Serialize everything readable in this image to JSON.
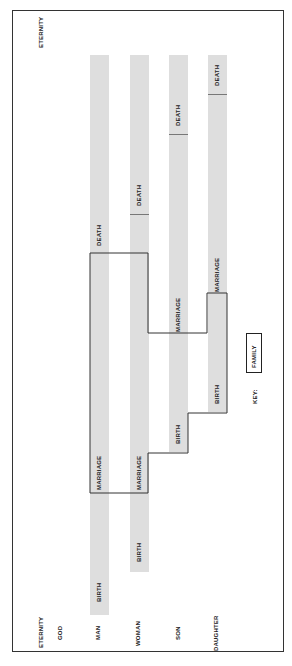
{
  "diagram": {
    "row_labels": {
      "eternity_top": "ETERNITY",
      "eternity_bottom": "ETERNITY",
      "god": "GOD",
      "man": "MAN",
      "woman": "WOMAN",
      "son": "SON",
      "daughter": "DAUGHTER"
    },
    "lifelines": [
      {
        "name": "MAN",
        "birth": "BIRTH",
        "marriage": "MARRIAGE",
        "death": "DEATH"
      },
      {
        "name": "WOMAN",
        "birth": "BIRTH",
        "marriage": "MARRIAGE",
        "death": "DEATH"
      },
      {
        "name": "SON",
        "birth": "BIRTH",
        "marriage": "MARRIAGE",
        "death": "DEATH"
      },
      {
        "name": "DAUGHTER",
        "birth": "BIRTH",
        "marriage": "MARRIAGE",
        "death": "DEATH"
      }
    ],
    "key": {
      "label": "KEY:",
      "box_label": "FAMILY"
    },
    "colors": {
      "bar": "#dedede",
      "line": "#333333"
    }
  }
}
